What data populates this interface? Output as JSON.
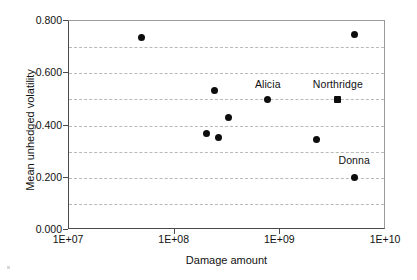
{
  "chart_data": {
    "type": "scatter",
    "title": "",
    "xlabel": "Damage amount",
    "ylabel": "Mean unhedged volatility",
    "xscale": "log",
    "xlim": [
      10000000,
      10000000000
    ],
    "ylim": [
      0.0,
      0.8
    ],
    "grid": true,
    "grid_spacing": 0.1,
    "legend": "none",
    "xticks": [
      "1E+07",
      "1E+08",
      "1E+09",
      "1E+10"
    ],
    "xtick_values": [
      10000000,
      100000000,
      1000000000,
      10000000000
    ],
    "yticks": [
      "0.000",
      "0.200",
      "0.400",
      "0.600",
      "0.800"
    ],
    "ytick_values": [
      0.0,
      0.2,
      0.4,
      0.6,
      0.8
    ],
    "series": [
      {
        "name": "Hurricanes and earthquakes",
        "marker": "circle",
        "points": [
          {
            "x": 49000000,
            "y": 0.735,
            "label": ""
          },
          {
            "x": 200000000,
            "y": 0.369,
            "label": ""
          },
          {
            "x": 240000000,
            "y": 0.535,
            "label": ""
          },
          {
            "x": 260000000,
            "y": 0.354,
            "label": ""
          },
          {
            "x": 320000000,
            "y": 0.431,
            "label": ""
          },
          {
            "x": 760000000,
            "y": 0.5,
            "label": "Alicia"
          },
          {
            "x": 2200000000,
            "y": 0.346,
            "label": ""
          },
          {
            "x": 5000000000,
            "y": 0.75,
            "label": ""
          },
          {
            "x": 5000000000,
            "y": 0.2,
            "label": "Donna"
          }
        ]
      },
      {
        "name": "Northridge",
        "marker": "square",
        "points": [
          {
            "x": 3500000000,
            "y": 0.5,
            "label": "Northridge"
          }
        ]
      }
    ],
    "annotations": [
      {
        "text": "Alicia",
        "x": 760000000,
        "y": 0.555
      },
      {
        "text": "Northridge",
        "x": 3500000000,
        "y": 0.555
      },
      {
        "text": "Donna",
        "x": 5000000000,
        "y": 0.265
      }
    ]
  },
  "colors": {
    "marker": "#0d0d0d",
    "axis": "#4a4a4a",
    "grid": "#b9b9b9",
    "text": "#111111",
    "background": "#ffffff"
  }
}
